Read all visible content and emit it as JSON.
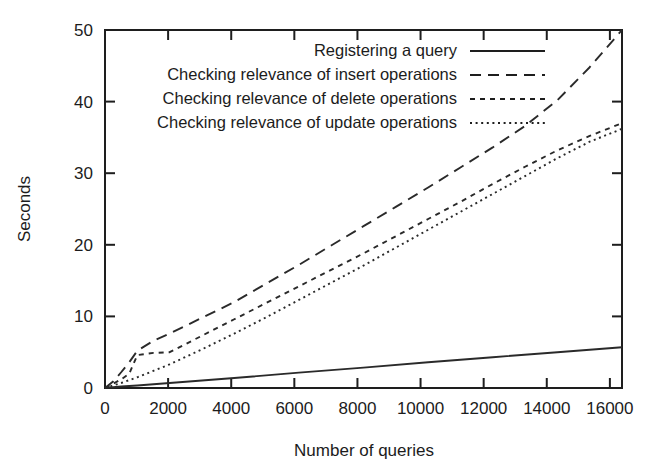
{
  "chart_data": {
    "type": "line",
    "title": "",
    "xlabel": "Number of queries",
    "ylabel": "Seconds",
    "xlim": [
      0,
      16384
    ],
    "ylim": [
      0,
      50
    ],
    "grid": false,
    "legend_position": "top-right-inside",
    "xticks": [
      0,
      2000,
      4000,
      6000,
      8000,
      10000,
      12000,
      14000,
      16000
    ],
    "xtick_labels": [
      "0",
      "2000",
      "4000",
      "6000",
      "8000",
      "10000",
      "12000",
      "14000",
      "16000"
    ],
    "yticks": [
      0,
      10,
      20,
      30,
      40,
      50
    ],
    "ytick_labels": [
      "0",
      "10",
      "20",
      "30",
      "40",
      "50"
    ],
    "series": [
      {
        "name": "Registering a query",
        "dash": "solid",
        "x": [
          0,
          256,
          512,
          1024,
          2048,
          3072,
          4096,
          6144,
          8192,
          10240,
          12288,
          14336,
          16384
        ],
        "values": [
          0.0,
          0.1,
          0.2,
          0.35,
          0.7,
          1.05,
          1.4,
          2.15,
          2.85,
          3.6,
          4.3,
          5.0,
          5.7
        ]
      },
      {
        "name": "Checking relevance of insert operations",
        "dash": "long-dash",
        "x": [
          0,
          256,
          512,
          768,
          1024,
          1536,
          2048,
          3072,
          4096,
          5120,
          6144,
          7168,
          8192,
          9216,
          10240,
          11264,
          12288,
          13312,
          14336,
          15360,
          16384
        ],
        "values": [
          0.0,
          0.9,
          2.2,
          3.6,
          5.2,
          6.6,
          7.6,
          9.8,
          12.0,
          14.6,
          17.2,
          19.9,
          22.6,
          25.3,
          28.0,
          30.8,
          33.6,
          36.6,
          40.2,
          44.8,
          50.0
        ]
      },
      {
        "name": "Checking relevance of delete operations",
        "dash": "dash-dot",
        "x": [
          0,
          256,
          512,
          768,
          1024,
          1536,
          2048,
          3072,
          4096,
          5120,
          6144,
          7168,
          8192,
          9216,
          10240,
          11264,
          12288,
          13312,
          14336,
          15360,
          16384
        ],
        "values": [
          0.0,
          0.6,
          1.2,
          2.0,
          4.6,
          4.9,
          5.0,
          7.3,
          9.6,
          11.9,
          14.2,
          16.5,
          18.8,
          21.2,
          23.6,
          26.0,
          28.5,
          30.9,
          33.2,
          35.2,
          37.0
        ]
      },
      {
        "name": "Checking relevance of update operations",
        "dash": "fine-dot",
        "x": [
          0,
          256,
          512,
          768,
          1024,
          1536,
          2048,
          3072,
          4096,
          5120,
          6144,
          7168,
          8192,
          9216,
          10240,
          11264,
          12288,
          13312,
          14336,
          15360,
          16384
        ],
        "values": [
          0.0,
          0.35,
          0.7,
          1.1,
          1.5,
          2.4,
          3.3,
          5.4,
          7.6,
          9.9,
          12.3,
          14.7,
          17.1,
          19.6,
          22.1,
          24.6,
          27.1,
          29.6,
          32.1,
          34.4,
          36.2
        ]
      }
    ]
  },
  "legend": {
    "entries": [
      {
        "label": "Registering a query",
        "dash": "solid"
      },
      {
        "label": "Checking relevance of insert operations",
        "dash": "long-dash"
      },
      {
        "label": "Checking relevance of delete operations",
        "dash": "dash-dot"
      },
      {
        "label": "Checking relevance of update operations",
        "dash": "fine-dot"
      }
    ]
  },
  "colors": {
    "ink": "#1e1e1e",
    "background": "#ffffff"
  }
}
